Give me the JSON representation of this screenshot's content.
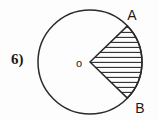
{
  "figure": {
    "problem_number": "6)",
    "background_color": "#fdfdfd",
    "stroke_color": "#2a2a2a",
    "labels": {
      "center": "o",
      "point_a": "A",
      "point_b": "B"
    },
    "geometry": {
      "circle_center_x": 90,
      "circle_center_y": 62,
      "circle_radius": 52,
      "radius_a_angle_deg": -44,
      "radius_b_angle_deg": 44,
      "sector_angle_deg": 88,
      "hatch_orientation": "horizontal",
      "hatch_spacing_px": 5
    },
    "label_positions": {
      "center_x": 79,
      "center_y": 66,
      "a_x": 131,
      "a_y": 19,
      "b_x": 139,
      "b_y": 111
    }
  }
}
